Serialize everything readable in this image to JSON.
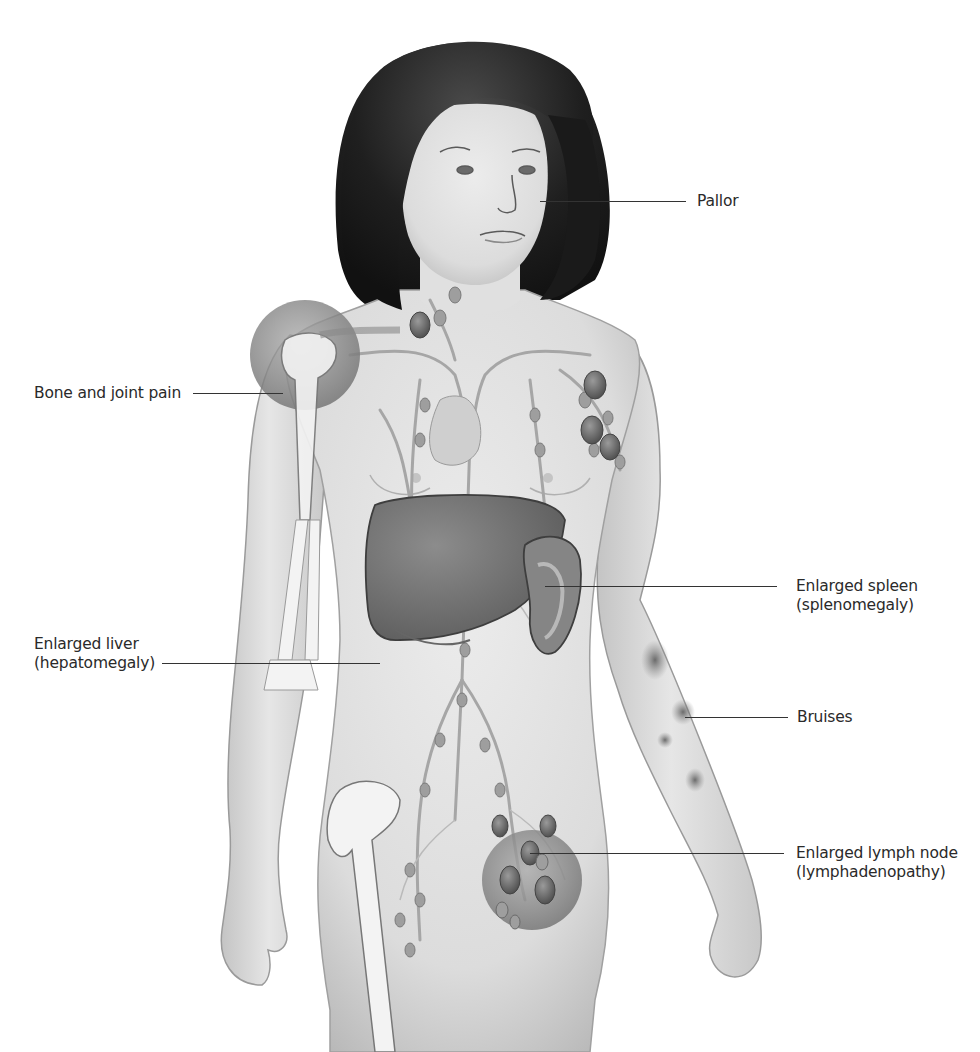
{
  "figure": {
    "style": "grayscale medical illustration",
    "colors": {
      "background": "#ffffff",
      "skin": "#e2e2e2",
      "skin_shadow": "#bdbdbd",
      "hair": "#1e1e1e",
      "organ": "#7a7a7a",
      "organ_dark": "#555555",
      "lymph_vessel": "#a6a6a6",
      "lymph_node": "#6f6f6f",
      "highlight_circle": "#8f8f8f",
      "bone": "#f2f2f2",
      "label_text": "#2a2a2a",
      "leader_line": "#333333"
    }
  },
  "labels": [
    {
      "id": "pallor",
      "lines": [
        "Pallor"
      ],
      "side": "right"
    },
    {
      "id": "bone-joint-pain",
      "lines": [
        "Bone and joint pain"
      ],
      "side": "left"
    },
    {
      "id": "enlarged-spleen",
      "lines": [
        "Enlarged spleen",
        "(splenomegaly)"
      ],
      "side": "right"
    },
    {
      "id": "enlarged-liver",
      "lines": [
        "Enlarged liver",
        "(hepatomegaly)"
      ],
      "side": "left"
    },
    {
      "id": "bruises",
      "lines": [
        "Bruises"
      ],
      "side": "right"
    },
    {
      "id": "enlarged-lymph-node",
      "lines": [
        "Enlarged lymph node",
        "(lymphadenopathy)"
      ],
      "side": "right"
    }
  ]
}
